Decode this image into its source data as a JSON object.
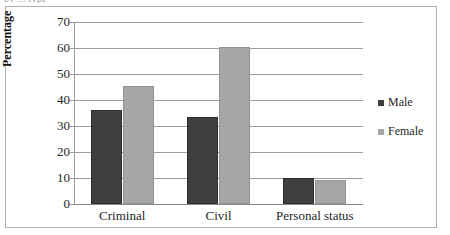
{
  "caption_clipped": "by ... type",
  "chart_data": {
    "type": "bar",
    "title": "",
    "subtitle": "",
    "xlabel": "",
    "ylabel": "Percentage",
    "ylim": [
      0,
      70
    ],
    "y_ticks": [
      70,
      60,
      50,
      40,
      30,
      20,
      10,
      0
    ],
    "grid": true,
    "legend_position": "right",
    "categories": [
      "Criminal",
      "Civil",
      "Personal status"
    ],
    "series": [
      {
        "name": "Male",
        "color": "#3f3f3f",
        "values": [
          36,
          33.5,
          10
        ]
      },
      {
        "name": "Female",
        "color": "#a6a6a6",
        "values": [
          45.5,
          60.3,
          9.2
        ]
      }
    ]
  },
  "legend": {
    "items": [
      {
        "label": "Male",
        "marker": "square-marker"
      },
      {
        "label": "Female",
        "marker": "square-marker"
      }
    ]
  }
}
